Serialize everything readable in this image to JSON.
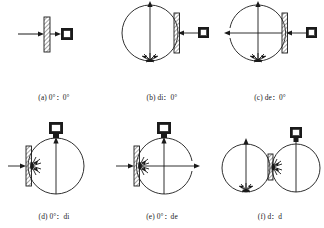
{
  "figure": {
    "stroke_color": "#1a1a1a",
    "hatch_color": "#555555",
    "panel_count": 6
  },
  "panels": [
    {
      "id": "a",
      "caption": "(a) 0°：0°",
      "geometry": "0:0",
      "illumination": "directional",
      "detection": "directional",
      "has_sphere": false,
      "sphere_count": 0,
      "sample_position": "center",
      "detector_position": "right",
      "source_arrow": "right",
      "burst": "none",
      "specular_port": "none",
      "elements": [
        "incident-beam-arrow",
        "sample-plate",
        "exit-beam-arrow",
        "detector"
      ]
    },
    {
      "id": "b",
      "caption": "(b) di：0°",
      "geometry": "di:0",
      "illumination": "diffuse",
      "detection": "directional",
      "has_sphere": true,
      "sphere_count": 1,
      "sample_position": "right",
      "detector_position": "right-outside",
      "source_arrow": "up",
      "burst": "bottom",
      "specular_port": "included",
      "elements": [
        "integrating-sphere",
        "vertical-beam-arrow",
        "diffuse-burst",
        "sample-plate",
        "detector"
      ]
    },
    {
      "id": "c",
      "caption": "(c) de：0°",
      "geometry": "de:0",
      "illumination": "diffuse",
      "detection": "directional",
      "has_sphere": true,
      "sphere_count": 1,
      "sample_position": "right",
      "detector_position": "right-outside",
      "source_arrow": "up",
      "burst": "bottom",
      "specular_port": "excluded-left",
      "elements": [
        "integrating-sphere",
        "vertical-beam-arrow",
        "diffuse-burst",
        "sample-plate",
        "detector",
        "specular-exclusion-port"
      ]
    },
    {
      "id": "d",
      "caption": "(d) 0°：di",
      "geometry": "0:di",
      "illumination": "directional",
      "detection": "diffuse",
      "has_sphere": true,
      "sphere_count": 1,
      "sample_position": "left",
      "detector_position": "top",
      "source_arrow": "right",
      "burst": "left-inner",
      "specular_port": "included",
      "elements": [
        "integrating-sphere",
        "incident-beam-arrow",
        "sample-plate",
        "diffuse-burst",
        "detector"
      ]
    },
    {
      "id": "e",
      "caption": "(e) 0°：de",
      "geometry": "0:de",
      "illumination": "directional",
      "detection": "diffuse",
      "has_sphere": true,
      "sphere_count": 1,
      "sample_position": "left",
      "detector_position": "top",
      "source_arrow": "right",
      "burst": "left-inner",
      "specular_port": "excluded-right",
      "elements": [
        "integrating-sphere",
        "incident-beam-arrow",
        "sample-plate",
        "diffuse-burst",
        "detector",
        "specular-exclusion-port"
      ]
    },
    {
      "id": "f",
      "caption": "(f) d：d",
      "geometry": "d:d",
      "illumination": "diffuse",
      "detection": "diffuse",
      "has_sphere": true,
      "sphere_count": 2,
      "sample_position": "between-spheres",
      "detector_position": "top-right",
      "source_arrow": "up",
      "burst": "bottom-left-and-center",
      "specular_port": "none",
      "elements": [
        "integrating-sphere-left",
        "integrating-sphere-right",
        "vertical-beam-arrow",
        "diffuse-burst",
        "sample-plate",
        "detector"
      ]
    }
  ]
}
